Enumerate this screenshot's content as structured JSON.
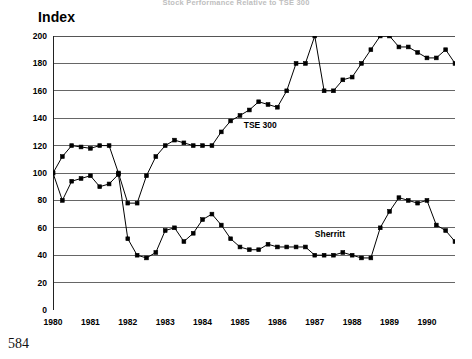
{
  "page": {
    "title": "Stock Performance Relative to TSE 300",
    "page_number": "584",
    "axis_title": "Index"
  },
  "labels": {
    "tse": "TSE 300",
    "sherritt": "Sherritt"
  },
  "chart_data": {
    "type": "line",
    "title": "Stock Performance Relative to TSE 300",
    "xlabel": "",
    "ylabel": "Index",
    "ylim": [
      0,
      200
    ],
    "ytick_step": 20,
    "yticks": [
      0,
      20,
      40,
      60,
      80,
      100,
      120,
      140,
      160,
      180,
      200
    ],
    "xlim": [
      1980,
      1990.75
    ],
    "xticks": [
      1980,
      1981,
      1982,
      1983,
      1984,
      1985,
      1986,
      1987,
      1988,
      1989,
      1990
    ],
    "xtick_labels": [
      "1980",
      "1981",
      "1982",
      "1983",
      "1984",
      "1985",
      "1986",
      "1987",
      "1988",
      "1989",
      "1990"
    ],
    "minor_xticks_per_year": 4,
    "grid": "horizontal",
    "legend": "inline-annotations",
    "marker": "square",
    "x": [
      1980.0,
      1980.25,
      1980.5,
      1980.75,
      1981.0,
      1981.25,
      1981.5,
      1981.75,
      1982.0,
      1982.25,
      1982.5,
      1982.75,
      1983.0,
      1983.25,
      1983.5,
      1983.75,
      1984.0,
      1984.25,
      1984.5,
      1984.75,
      1985.0,
      1985.25,
      1985.5,
      1985.75,
      1986.0,
      1986.25,
      1986.5,
      1986.75,
      1987.0,
      1987.25,
      1987.5,
      1987.75,
      1988.0,
      1988.25,
      1988.5,
      1988.75,
      1989.0,
      1989.25,
      1989.5,
      1989.75,
      1990.0,
      1990.25,
      1990.5,
      1990.75
    ],
    "series": [
      {
        "name": "TSE 300",
        "values": [
          100,
          112,
          120,
          119,
          118,
          120,
          120,
          100,
          78,
          78,
          98,
          112,
          120,
          124,
          122,
          120,
          120,
          120,
          130,
          138,
          142,
          146,
          152,
          150,
          148,
          160,
          180,
          180,
          200,
          160,
          160,
          168,
          170,
          180,
          190,
          200,
          200,
          192,
          192,
          188,
          184,
          184,
          190,
          180
        ],
        "label_x": 1985.1,
        "label_y": 134
      },
      {
        "name": "Sherritt",
        "values": [
          100,
          80,
          94,
          96,
          98,
          90,
          92,
          99,
          52,
          40,
          38,
          42,
          58,
          60,
          50,
          56,
          66,
          70,
          62,
          52,
          46,
          44,
          44,
          48,
          46,
          46,
          46,
          46,
          40,
          40,
          40,
          42,
          40,
          38,
          38,
          60,
          72,
          82,
          80,
          78,
          80,
          62,
          58,
          50
        ],
        "label_x": 1987.0,
        "label_y": 55
      }
    ]
  }
}
